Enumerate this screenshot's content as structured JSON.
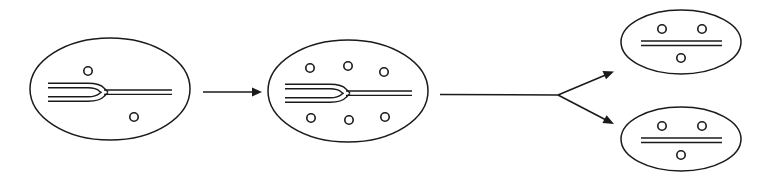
{
  "figure": {
    "name": "dna-replication-cell-division-diagram",
    "background_color": "#ffffff",
    "stroke_color": "#1a1a1a",
    "width": 757,
    "height": 181
  },
  "stages": [
    {
      "id": "parent-cell",
      "label": "parent-cell",
      "ellipse": {
        "cx": 110,
        "cy": 89,
        "rx": 80,
        "ry": 51
      },
      "plasmids": [
        {
          "cx": 88,
          "cy": 71,
          "r": 4.2
        },
        {
          "cx": 134,
          "cy": 117,
          "r": 4.2
        }
      ],
      "dna": {
        "type": "replication-fork",
        "tail_x": 48,
        "fork_x": 100,
        "head_x": 172,
        "cy": 92,
        "gap": 4.5,
        "branch_offset": 9
      }
    },
    {
      "id": "replicating-cell",
      "label": "replicating-cell",
      "ellipse": {
        "cx": 348,
        "cy": 91,
        "rx": 80,
        "ry": 51
      },
      "plasmids": [
        {
          "cx": 310,
          "cy": 68,
          "r": 4.2
        },
        {
          "cx": 348,
          "cy": 66,
          "r": 4.2
        },
        {
          "cx": 384,
          "cy": 72,
          "r": 4.2
        },
        {
          "cx": 311,
          "cy": 118,
          "r": 4.2
        },
        {
          "cx": 349,
          "cy": 120,
          "r": 4.2
        },
        {
          "cx": 385,
          "cy": 117,
          "r": 4.2
        }
      ],
      "dna": {
        "type": "replication-fork",
        "tail_x": 285,
        "fork_x": 345,
        "head_x": 412,
        "cy": 93,
        "gap": 4.5,
        "branch_offset": 9
      }
    },
    {
      "id": "daughter-cell-top",
      "label": "daughter-cell-top",
      "ellipse": {
        "cx": 681,
        "cy": 42,
        "rx": 60,
        "ry": 32
      },
      "plasmids": [
        {
          "cx": 662,
          "cy": 29,
          "r": 4.2
        },
        {
          "cx": 702,
          "cy": 29,
          "r": 4.2
        },
        {
          "cx": 681,
          "cy": 58,
          "r": 4.2
        }
      ],
      "dna": {
        "type": "duplex-line",
        "x1": 641,
        "x2": 722,
        "cy": 43,
        "gap": 4.5
      }
    },
    {
      "id": "daughter-cell-bottom",
      "label": "daughter-cell-bottom",
      "ellipse": {
        "cx": 681,
        "cy": 139,
        "rx": 60,
        "ry": 32
      },
      "plasmids": [
        {
          "cx": 662,
          "cy": 126,
          "r": 4.2
        },
        {
          "cx": 702,
          "cy": 126,
          "r": 4.2
        },
        {
          "cx": 681,
          "cy": 155,
          "r": 4.2
        }
      ],
      "dna": {
        "type": "duplex-line",
        "x1": 641,
        "x2": 722,
        "cy": 140,
        "gap": 4.5
      }
    }
  ],
  "arrows": [
    {
      "id": "arrow-replication",
      "label": "arrow-replication",
      "type": "straight",
      "x1": 203,
      "y1": 92,
      "x2": 262,
      "y2": 92
    },
    {
      "id": "arrow-division-stem",
      "label": "arrow-division-stem",
      "type": "stem",
      "x1": 440,
      "y1": 94,
      "x2": 558,
      "y2": 95
    },
    {
      "id": "arrow-division-up",
      "label": "arrow-division-up",
      "type": "branch",
      "x1": 558,
      "y1": 95,
      "x2": 613,
      "y2": 72
    },
    {
      "id": "arrow-division-down",
      "label": "arrow-division-down",
      "type": "branch",
      "x1": 558,
      "y1": 95,
      "x2": 613,
      "y2": 124
    }
  ]
}
